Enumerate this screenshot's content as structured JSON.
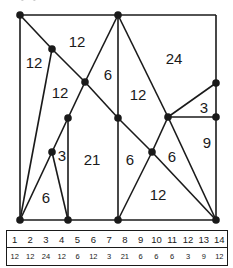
{
  "diagram": {
    "stroke_color": "#1a1a1a",
    "points": {
      "A": [
        20,
        15
      ],
      "B": [
        118,
        15
      ],
      "C": [
        52,
        49
      ],
      "D": [
        85,
        82
      ],
      "E": [
        68,
        118
      ],
      "F": [
        52,
        152
      ],
      "G": [
        68,
        220
      ],
      "H": [
        118,
        118
      ],
      "I": [
        118,
        220
      ],
      "J": [
        168,
        117
      ],
      "K": [
        216,
        83
      ],
      "L": [
        216,
        117
      ],
      "M": [
        152,
        152
      ],
      "N": [
        216,
        220
      ],
      "BL": [
        20,
        220
      ],
      "TR": [
        216,
        15
      ]
    },
    "segments": [
      [
        "A",
        "B"
      ],
      [
        "B",
        "TR"
      ],
      [
        "TR",
        "K"
      ],
      [
        "K",
        "L"
      ],
      [
        "L",
        "N"
      ],
      [
        "A",
        "BL"
      ],
      [
        "BL",
        "G"
      ],
      [
        "G",
        "I"
      ],
      [
        "I",
        "N"
      ],
      [
        "A",
        "C"
      ],
      [
        "C",
        "D"
      ],
      [
        "D",
        "H"
      ],
      [
        "H",
        "M"
      ],
      [
        "M",
        "N"
      ],
      [
        "C",
        "BL"
      ],
      [
        "B",
        "D"
      ],
      [
        "D",
        "E"
      ],
      [
        "E",
        "F"
      ],
      [
        "F",
        "BL"
      ],
      [
        "F",
        "G"
      ],
      [
        "E",
        "G"
      ],
      [
        "B",
        "H"
      ],
      [
        "H",
        "I"
      ],
      [
        "B",
        "J"
      ],
      [
        "J",
        "K"
      ],
      [
        "J",
        "L"
      ],
      [
        "J",
        "M"
      ],
      [
        "M",
        "I"
      ],
      [
        "J",
        "N"
      ]
    ],
    "region_labels": [
      {
        "text": "12",
        "x": 77,
        "y": 47
      },
      {
        "text": "12",
        "x": 34,
        "y": 68
      },
      {
        "text": "24",
        "x": 174,
        "y": 64
      },
      {
        "text": "6",
        "x": 108,
        "y": 80
      },
      {
        "text": "12",
        "x": 60,
        "y": 98
      },
      {
        "text": "12",
        "x": 138,
        "y": 100
      },
      {
        "text": "3",
        "x": 204,
        "y": 113
      },
      {
        "text": "9",
        "x": 207,
        "y": 148
      },
      {
        "text": "3",
        "x": 62,
        "y": 161
      },
      {
        "text": "21",
        "x": 92,
        "y": 165
      },
      {
        "text": "6",
        "x": 130,
        "y": 165
      },
      {
        "text": "6",
        "x": 172,
        "y": 162
      },
      {
        "text": "6",
        "x": 46,
        "y": 203
      },
      {
        "text": "12",
        "x": 158,
        "y": 200
      }
    ]
  },
  "table": {
    "indices": [
      "1",
      "2",
      "3",
      "4",
      "5",
      "6",
      "7",
      "8",
      "9",
      "10",
      "11",
      "12",
      "13",
      "14"
    ],
    "values": [
      "12",
      "12",
      "24",
      "12",
      "6",
      "12",
      "3",
      "21",
      "6",
      "6",
      "6",
      "3",
      "9",
      "12"
    ]
  }
}
